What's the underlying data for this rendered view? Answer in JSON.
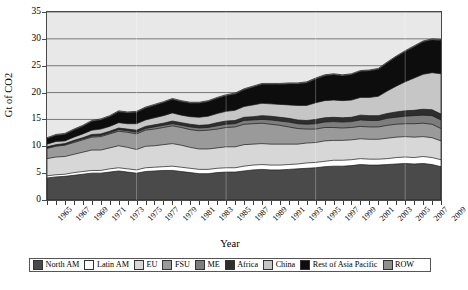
{
  "chart_data": {
    "type": "area",
    "title": "",
    "xlabel": "Year",
    "ylabel": "Gt of CO2",
    "ylim": [
      0,
      35
    ],
    "yticks": [
      0,
      5,
      10,
      15,
      20,
      25,
      30,
      35
    ],
    "grid": true,
    "legend_position": "bottom",
    "stacked": true,
    "x": [
      1965,
      1966,
      1967,
      1968,
      1969,
      1970,
      1971,
      1972,
      1973,
      1974,
      1975,
      1976,
      1977,
      1978,
      1979,
      1980,
      1981,
      1982,
      1983,
      1984,
      1985,
      1986,
      1987,
      1988,
      1989,
      1990,
      1991,
      1992,
      1993,
      1994,
      1995,
      1996,
      1997,
      1998,
      1999,
      2000,
      2001,
      2002,
      2003,
      2004,
      2005,
      2006,
      2007,
      2008,
      2009
    ],
    "xtick_labels": [
      "1965",
      "1967",
      "1969",
      "1971",
      "1973",
      "1975",
      "1977",
      "1979",
      "1981",
      "1983",
      "1985",
      "1987",
      "1989",
      "1991",
      "1993",
      "1995",
      "1997",
      "1999",
      "2001",
      "2003",
      "2005",
      "2007",
      "2009"
    ],
    "series": [
      {
        "name": "North AM",
        "color": "#4a4a4a",
        "values": [
          4.1,
          4.3,
          4.4,
          4.6,
          4.8,
          5.0,
          5.0,
          5.2,
          5.4,
          5.2,
          5.0,
          5.3,
          5.4,
          5.5,
          5.5,
          5.3,
          5.1,
          4.9,
          4.9,
          5.1,
          5.2,
          5.2,
          5.4,
          5.6,
          5.7,
          5.6,
          5.6,
          5.7,
          5.8,
          5.9,
          6.0,
          6.2,
          6.3,
          6.3,
          6.4,
          6.6,
          6.5,
          6.5,
          6.6,
          6.7,
          6.8,
          6.7,
          6.8,
          6.6,
          6.2
        ]
      },
      {
        "name": "Latin AM",
        "color": "#ffffff",
        "values": [
          0.4,
          0.4,
          0.4,
          0.5,
          0.5,
          0.5,
          0.5,
          0.6,
          0.6,
          0.6,
          0.6,
          0.7,
          0.7,
          0.7,
          0.8,
          0.8,
          0.8,
          0.8,
          0.8,
          0.8,
          0.8,
          0.8,
          0.9,
          0.9,
          0.9,
          0.9,
          0.9,
          0.9,
          0.9,
          1.0,
          1.0,
          1.0,
          1.1,
          1.1,
          1.1,
          1.1,
          1.1,
          1.1,
          1.1,
          1.2,
          1.2,
          1.2,
          1.3,
          1.3,
          1.3
        ]
      },
      {
        "name": "EU",
        "color": "#d7d7d7",
        "values": [
          3.2,
          3.3,
          3.3,
          3.4,
          3.6,
          3.8,
          3.8,
          3.9,
          4.1,
          4.0,
          3.8,
          4.0,
          4.0,
          4.1,
          4.2,
          4.1,
          3.9,
          3.8,
          3.8,
          3.8,
          3.9,
          3.9,
          4.0,
          3.9,
          3.9,
          3.9,
          3.9,
          3.8,
          3.7,
          3.7,
          3.7,
          3.8,
          3.7,
          3.7,
          3.7,
          3.7,
          3.7,
          3.7,
          3.8,
          3.8,
          3.8,
          3.8,
          3.7,
          3.7,
          3.5
        ]
      },
      {
        "name": "FSU",
        "color": "#9a9a9a",
        "values": [
          1.9,
          2.0,
          2.1,
          2.2,
          2.3,
          2.4,
          2.5,
          2.6,
          2.7,
          2.8,
          2.9,
          3.0,
          3.1,
          3.2,
          3.3,
          3.3,
          3.3,
          3.4,
          3.5,
          3.5,
          3.6,
          3.7,
          3.8,
          3.8,
          3.8,
          3.7,
          3.5,
          3.2,
          2.9,
          2.6,
          2.5,
          2.5,
          2.4,
          2.3,
          2.3,
          2.3,
          2.3,
          2.3,
          2.4,
          2.4,
          2.4,
          2.5,
          2.5,
          2.5,
          2.3
        ]
      },
      {
        "name": "ME",
        "color": "#7d7d7d",
        "values": [
          0.1,
          0.1,
          0.1,
          0.2,
          0.2,
          0.2,
          0.2,
          0.2,
          0.3,
          0.3,
          0.3,
          0.3,
          0.4,
          0.4,
          0.4,
          0.4,
          0.5,
          0.5,
          0.5,
          0.6,
          0.6,
          0.6,
          0.7,
          0.7,
          0.7,
          0.8,
          0.8,
          0.9,
          0.9,
          0.9,
          1.0,
          1.0,
          1.1,
          1.1,
          1.1,
          1.2,
          1.2,
          1.2,
          1.3,
          1.3,
          1.4,
          1.5,
          1.5,
          1.6,
          1.6
        ]
      },
      {
        "name": "Africa",
        "color": "#2e2e2e",
        "values": [
          0.2,
          0.2,
          0.2,
          0.2,
          0.2,
          0.3,
          0.3,
          0.3,
          0.3,
          0.3,
          0.4,
          0.4,
          0.4,
          0.4,
          0.5,
          0.5,
          0.5,
          0.5,
          0.5,
          0.6,
          0.6,
          0.6,
          0.6,
          0.6,
          0.7,
          0.7,
          0.7,
          0.7,
          0.7,
          0.7,
          0.8,
          0.8,
          0.8,
          0.8,
          0.8,
          0.9,
          0.9,
          0.9,
          0.9,
          1.0,
          1.0,
          1.0,
          1.1,
          1.1,
          1.1
        ]
      },
      {
        "name": "China",
        "color": "#c6c6c6",
        "values": [
          0.5,
          0.6,
          0.5,
          0.6,
          0.7,
          0.8,
          0.9,
          0.9,
          1.0,
          1.0,
          1.2,
          1.2,
          1.3,
          1.4,
          1.5,
          1.4,
          1.4,
          1.5,
          1.6,
          1.7,
          1.8,
          1.9,
          2.0,
          2.2,
          2.3,
          2.3,
          2.4,
          2.5,
          2.7,
          2.8,
          3.1,
          3.2,
          3.2,
          3.2,
          3.2,
          3.3,
          3.4,
          3.6,
          4.2,
          4.8,
          5.4,
          6.0,
          6.5,
          6.9,
          7.5
        ]
      },
      {
        "name": "Rest of Asia Pacific",
        "color": "#0d0d0d",
        "values": [
          1.0,
          1.1,
          1.2,
          1.3,
          1.4,
          1.6,
          1.7,
          1.8,
          2.0,
          2.0,
          2.1,
          2.2,
          2.3,
          2.4,
          2.5,
          2.5,
          2.5,
          2.6,
          2.7,
          2.8,
          2.9,
          3.0,
          3.1,
          3.3,
          3.5,
          3.6,
          3.7,
          3.9,
          4.0,
          4.2,
          4.4,
          4.6,
          4.7,
          4.6,
          4.7,
          4.8,
          4.9,
          5.0,
          5.2,
          5.4,
          5.6,
          5.8,
          6.0,
          6.1,
          6.2
        ]
      },
      {
        "name": "ROW",
        "color": "#8f8f8f",
        "values": [
          0.2,
          0.2,
          0.2,
          0.2,
          0.2,
          0.2,
          0.2,
          0.2,
          0.2,
          0.2,
          0.2,
          0.2,
          0.2,
          0.2,
          0.2,
          0.2,
          0.2,
          0.2,
          0.2,
          0.2,
          0.2,
          0.2,
          0.2,
          0.2,
          0.2,
          0.2,
          0.2,
          0.2,
          0.2,
          0.2,
          0.2,
          0.2,
          0.2,
          0.2,
          0.2,
          0.2,
          0.2,
          0.2,
          0.2,
          0.2,
          0.2,
          0.2,
          0.2,
          0.2,
          0.2
        ]
      }
    ]
  },
  "legend": {
    "items": [
      {
        "label": "North AM"
      },
      {
        "label": "Latin AM"
      },
      {
        "label": "EU"
      },
      {
        "label": "FSU"
      },
      {
        "label": "ME"
      },
      {
        "label": "Africa"
      },
      {
        "label": "China"
      },
      {
        "label": "Rest of Asia Pacific"
      },
      {
        "label": "ROW"
      }
    ]
  },
  "colors": {
    "plot_background": "#e8e8e8",
    "frame": "#4a4a4a",
    "gridline": "#5a5a5a"
  }
}
